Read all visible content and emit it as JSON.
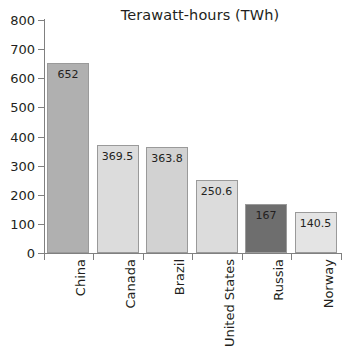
{
  "chart_data": {
    "type": "bar",
    "title": "Terawatt-hours (TWh)",
    "xlabel": "",
    "ylabel": "",
    "ylim": [
      0,
      800
    ],
    "ytick_step": 100,
    "yticks": [
      "800",
      "700",
      "600",
      "500",
      "400",
      "300",
      "200",
      "100",
      "0"
    ],
    "grid": false,
    "legend": "none",
    "categories": [
      "China",
      "Canada",
      "Brazil",
      "United States",
      "Russia",
      "Norway"
    ],
    "values": [
      652,
      369.5,
      363.8,
      250.6,
      167,
      140.5
    ],
    "value_labels": [
      "652",
      "369.5",
      "363.8",
      "250.6",
      "167",
      "140.5"
    ],
    "bar_colors": [
      "#b0b0b0",
      "#dcdcdc",
      "#d2d2d2",
      "#dcdcdc",
      "#6e6e6e",
      "#e4e4e4"
    ],
    "bar_border_color": "#9a9a9a",
    "axis_color": "#808080",
    "text_color": "#231f20",
    "background": "#ffffff"
  }
}
